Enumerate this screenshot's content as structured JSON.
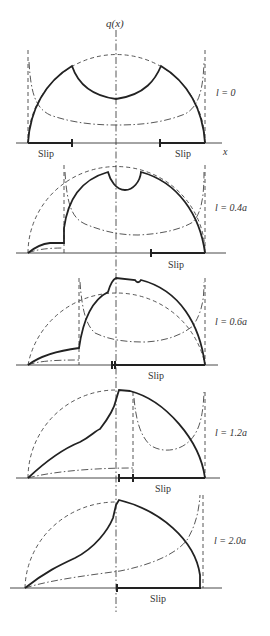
{
  "figure": {
    "y_axis_label": "q(x)",
    "x_axis_label": "x",
    "legend_line_styles": {
      "solid": "traction distribution q(x)",
      "dashed": "full-stick reference (semi-ellipse)",
      "dash_dot": "slip/correction distribution"
    },
    "panels": [
      {
        "label": "l = 0",
        "slip_labels": [
          "Slip",
          "Slip"
        ]
      },
      {
        "label": "l = 0.4a",
        "slip_labels": [
          "Slip"
        ]
      },
      {
        "label": "l = 0.6a",
        "slip_labels": [
          "Slip"
        ]
      },
      {
        "label": "l = 1.2a",
        "slip_labels": [
          "Slip"
        ]
      },
      {
        "label": "l = 2.0a",
        "slip_labels": [
          "Slip"
        ]
      }
    ]
  }
}
